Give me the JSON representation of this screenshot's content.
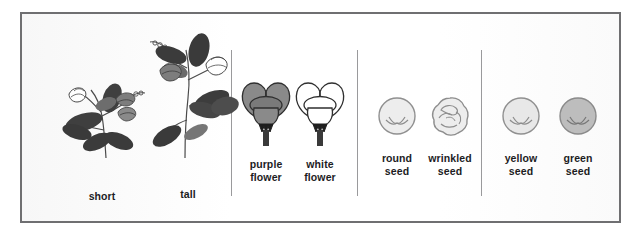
{
  "figure": {
    "border_color": "#6f6f71",
    "divider_color": "#9a9a9c",
    "background_color": "#fdfdfd",
    "label_color": "#1d1d1f"
  },
  "groups": [
    {
      "name": "stem-length",
      "items": [
        {
          "key": "short",
          "label": "short",
          "icon": "short-pea-plant-icon"
        },
        {
          "key": "tall",
          "label": "tall",
          "icon": "tall-pea-plant-icon"
        }
      ]
    },
    {
      "name": "flower-color",
      "items": [
        {
          "key": "purple-flower",
          "label": "purple\nflower",
          "icon": "purple-flower-icon",
          "color": "#808080"
        },
        {
          "key": "white-flower",
          "label": "white\nflower",
          "icon": "white-flower-icon",
          "color": "#ffffff"
        }
      ]
    },
    {
      "name": "seed-shape",
      "items": [
        {
          "key": "round-seed",
          "label": "round\nseed",
          "icon": "round-seed-icon",
          "color": "#ededed"
        },
        {
          "key": "wrinkled-seed",
          "label": "wrinkled\nseed",
          "icon": "wrinkled-seed-icon",
          "color": "#ededed"
        }
      ]
    },
    {
      "name": "seed-color",
      "items": [
        {
          "key": "yellow-seed",
          "label": "yellow\nseed",
          "icon": "yellow-seed-icon",
          "color": "#e8e8e8"
        },
        {
          "key": "green-seed",
          "label": "green\nseed",
          "icon": "green-seed-icon",
          "color": "#bdbdbd"
        }
      ]
    }
  ]
}
